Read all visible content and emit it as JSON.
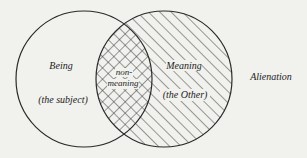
{
  "diagram": {
    "type": "venn",
    "background_color": "#f1f1ee",
    "stroke_color": "#2a2a2a",
    "sets": [
      {
        "id": "being",
        "label": "Being",
        "sublabel": "(the subject)",
        "fill": "none",
        "cx": 84,
        "cy": 79,
        "r": 68
      },
      {
        "id": "meaning",
        "label": "Meaning",
        "sublabel": "(the Other)",
        "fill": "diagonal-hatch",
        "cx": 164,
        "cy": 79,
        "r": 68
      }
    ],
    "intersection": {
      "label_line1": "non-",
      "label_line2": "meaning",
      "fill": "cross-hatch"
    },
    "outside_label": "Alienation"
  }
}
